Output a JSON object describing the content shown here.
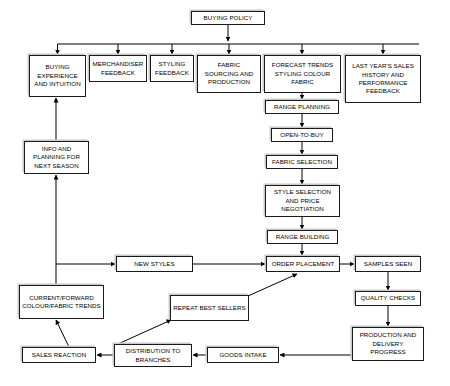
{
  "diagram": {
    "style": {
      "box_border_color": "#1a1a1a",
      "box_fill_color": "#ffffff",
      "box_shadow_color": "#c9c9c9",
      "line_color": "#000000",
      "text_color": "#000000"
    },
    "nodes": [
      {
        "id": "buying_policy",
        "label": "BUYING POLICY",
        "x": 191,
        "y": 11,
        "w": 74,
        "h": 14
      },
      {
        "id": "buying_experience",
        "label": "BUYING EXPERIENCE AND INTUITION",
        "x": 29,
        "y": 55,
        "w": 57,
        "h": 42
      },
      {
        "id": "merchandiser_feedback",
        "label": "MERCHANDISER FEEDBACK",
        "x": 89,
        "y": 55,
        "w": 58,
        "h": 27
      },
      {
        "id": "styling_feedback",
        "label": "STYLING FEEDBACK",
        "x": 150,
        "y": 55,
        "w": 44,
        "h": 27
      },
      {
        "id": "fabric_sourcing",
        "label": "FABRIC SOURCING AND PRODUCTION",
        "x": 197,
        "y": 55,
        "w": 64,
        "h": 38
      },
      {
        "id": "forecast_trends",
        "label": "FORECAST TRENDS STYLING COLOUR FABRIC",
        "x": 264,
        "y": 55,
        "w": 77,
        "h": 38
      },
      {
        "id": "last_years_sales",
        "label": "LAST YEAR'S SALES HISTORY AND PERFORMANCE FEEDBACK",
        "x": 345,
        "y": 55,
        "w": 76,
        "h": 48
      },
      {
        "id": "range_planning",
        "label": "RANGE PLANNING",
        "x": 265,
        "y": 100,
        "w": 74,
        "h": 14
      },
      {
        "id": "open_to_buy",
        "label": "OPEN-TO-BUY",
        "x": 271,
        "y": 128,
        "w": 62,
        "h": 14
      },
      {
        "id": "fabric_selection",
        "label": "FABRIC SELECTION",
        "x": 266,
        "y": 155,
        "w": 72,
        "h": 14
      },
      {
        "id": "style_selection",
        "label": "STYLE SELECTION AND PRICE NEGOTIATION",
        "x": 265,
        "y": 185,
        "w": 75,
        "h": 32
      },
      {
        "id": "range_building",
        "label": "RANGE BUILDING",
        "x": 267,
        "y": 230,
        "w": 71,
        "h": 14
      },
      {
        "id": "info_planning",
        "label": "INFO AND PLANNING FOR NEXT SEASON",
        "x": 24,
        "y": 141,
        "w": 65,
        "h": 33
      },
      {
        "id": "new_styles",
        "label": "NEW STYLES",
        "x": 116,
        "y": 256,
        "w": 77,
        "h": 16
      },
      {
        "id": "order_placement",
        "label": "ORDER PLACEMENT",
        "x": 266,
        "y": 256,
        "w": 74,
        "h": 16
      },
      {
        "id": "samples_seen",
        "label": "SAMPLES SEEN",
        "x": 355,
        "y": 256,
        "w": 66,
        "h": 16
      },
      {
        "id": "current_forward",
        "label": "CURRENT/FORWARD COLOUR/FABRIC TRENDS",
        "x": 19,
        "y": 285,
        "w": 85,
        "h": 34
      },
      {
        "id": "repeat_best_sellers",
        "label": "REPEAT BEST SELLERS",
        "x": 170,
        "y": 295,
        "w": 79,
        "h": 26
      },
      {
        "id": "quality_checks",
        "label": "QUALITY CHECKS",
        "x": 355,
        "y": 291,
        "w": 66,
        "h": 15
      },
      {
        "id": "production_delivery",
        "label": "PRODUCTION AND DELIVERY PROGRESS",
        "x": 352,
        "y": 327,
        "w": 72,
        "h": 34
      },
      {
        "id": "sales_reaction",
        "label": "SALES REACTION",
        "x": 22,
        "y": 347,
        "w": 74,
        "h": 16
      },
      {
        "id": "distribution_branches",
        "label": "DISTRIBUTION TO BRANCHES",
        "x": 114,
        "y": 344,
        "w": 78,
        "h": 23
      },
      {
        "id": "goods_intake",
        "label": "GOODS INTAKE",
        "x": 207,
        "y": 347,
        "w": 72,
        "h": 16
      }
    ],
    "edges": [
      {
        "id": "policy-to-bus",
        "from": "buying_policy",
        "to": "distribution-bus"
      },
      {
        "id": "bus-to-buying-exp",
        "from": "distribution-bus",
        "to": "buying_experience"
      },
      {
        "id": "bus-to-merchandiser",
        "from": "distribution-bus",
        "to": "merchandiser_feedback"
      },
      {
        "id": "bus-to-styling",
        "from": "distribution-bus",
        "to": "styling_feedback"
      },
      {
        "id": "bus-to-fabric",
        "from": "distribution-bus",
        "to": "fabric_sourcing"
      },
      {
        "id": "bus-to-forecast",
        "from": "distribution-bus",
        "to": "forecast_trends"
      },
      {
        "id": "bus-to-last-years",
        "from": "distribution-bus",
        "to": "last_years_sales"
      },
      {
        "id": "forecast-to-range",
        "from": "forecast_trends",
        "to": "range_planning"
      },
      {
        "id": "range-to-otb",
        "from": "range_planning",
        "to": "open_to_buy"
      },
      {
        "id": "otb-to-fabric-sel",
        "from": "open_to_buy",
        "to": "fabric_selection"
      },
      {
        "id": "fabric-sel-to-style",
        "from": "fabric_selection",
        "to": "style_selection"
      },
      {
        "id": "style-to-range-build",
        "from": "style_selection",
        "to": "range_building"
      },
      {
        "id": "range-build-to-order",
        "from": "range_building",
        "to": "order_placement"
      },
      {
        "id": "info-to-buying-exp",
        "from": "info_planning",
        "to": "buying_experience"
      },
      {
        "id": "current-to-info",
        "from": "current_forward",
        "to": "info_planning"
      },
      {
        "id": "current-to-new",
        "from": "current_forward",
        "to": "new_styles"
      },
      {
        "id": "new-to-order",
        "from": "new_styles",
        "to": "order_placement"
      },
      {
        "id": "order-to-samples",
        "from": "order_placement",
        "to": "samples_seen"
      },
      {
        "id": "samples-to-quality",
        "from": "samples_seen",
        "to": "quality_checks"
      },
      {
        "id": "quality-to-production",
        "from": "quality_checks",
        "to": "production_delivery"
      },
      {
        "id": "production-to-goods",
        "from": "production_delivery",
        "to": "goods_intake"
      },
      {
        "id": "goods-to-distribution",
        "from": "goods_intake",
        "to": "distribution_branches"
      },
      {
        "id": "distribution-to-sales",
        "from": "distribution_branches",
        "to": "sales_reaction"
      },
      {
        "id": "distribution-to-repeat",
        "from": "distribution_branches",
        "to": "repeat_best_sellers"
      },
      {
        "id": "repeat-to-order",
        "from": "repeat_best_sellers",
        "to": "order_placement"
      },
      {
        "id": "sales-to-current",
        "from": "sales_reaction",
        "to": "current_forward"
      }
    ]
  }
}
